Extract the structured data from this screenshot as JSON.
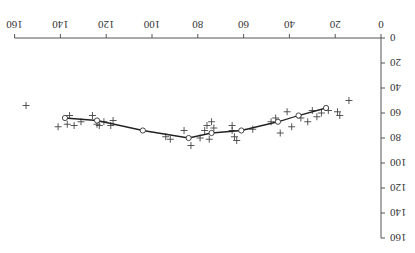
{
  "chart_data": {
    "type": "scatter",
    "rotation_deg": 180,
    "title": "",
    "xlabel": "",
    "ylabel": "",
    "xlim": [
      0,
      160
    ],
    "ylim": [
      0,
      160
    ],
    "x_ticks": [
      0,
      20,
      40,
      60,
      80,
      100,
      120,
      140,
      160
    ],
    "y_ticks": [
      0,
      20,
      40,
      60,
      80,
      100,
      120,
      140,
      160
    ],
    "grid": false,
    "legend": null,
    "series": [
      {
        "name": "observations",
        "marker": "+",
        "points": [
          [
            155,
            54
          ],
          [
            141,
            71
          ],
          [
            137,
            69
          ],
          [
            136,
            62
          ],
          [
            134,
            70
          ],
          [
            131,
            67
          ],
          [
            126,
            62
          ],
          [
            124,
            69
          ],
          [
            123,
            70
          ],
          [
            121,
            67
          ],
          [
            118,
            70
          ],
          [
            117,
            66
          ],
          [
            94,
            79
          ],
          [
            92,
            81
          ],
          [
            86,
            74
          ],
          [
            83,
            86
          ],
          [
            79,
            80
          ],
          [
            77,
            74
          ],
          [
            76,
            70
          ],
          [
            75,
            81
          ],
          [
            74,
            67
          ],
          [
            73,
            72
          ],
          [
            65,
            74
          ],
          [
            64,
            79
          ],
          [
            63,
            82
          ],
          [
            65,
            70
          ],
          [
            56,
            73
          ],
          [
            48,
            67
          ],
          [
            46,
            64
          ],
          [
            44,
            76
          ],
          [
            41,
            59
          ],
          [
            39,
            71
          ],
          [
            35,
            64
          ],
          [
            32,
            67
          ],
          [
            30,
            58
          ],
          [
            28,
            63
          ],
          [
            26,
            60
          ],
          [
            23,
            58
          ],
          [
            19,
            59
          ],
          [
            18,
            62
          ],
          [
            14,
            50
          ]
        ]
      },
      {
        "name": "smoothed fit",
        "marker": "o",
        "line": true,
        "points": [
          [
            24,
            56
          ],
          [
            36,
            62
          ],
          [
            45,
            67
          ],
          [
            61,
            74
          ],
          [
            74,
            76
          ],
          [
            84,
            80
          ],
          [
            104,
            74
          ],
          [
            124,
            66
          ],
          [
            138,
            64
          ]
        ]
      }
    ]
  }
}
